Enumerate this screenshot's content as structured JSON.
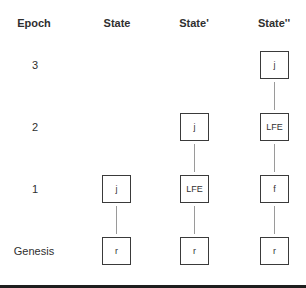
{
  "headers": {
    "epoch": "Epoch",
    "state": "State",
    "state_prime": "State'",
    "state_double_prime": "State''"
  },
  "rows": {
    "epoch3": "3",
    "epoch2": "2",
    "epoch1": "1",
    "genesis": "Genesis"
  },
  "columns": {
    "state": {
      "epoch1": "j",
      "genesis": "r"
    },
    "state_prime": {
      "epoch2": "j",
      "epoch1": "LFE",
      "genesis": "r"
    },
    "state_double_prime": {
      "epoch3": "j",
      "epoch2": "LFE",
      "epoch1": "f",
      "genesis": "r"
    }
  }
}
